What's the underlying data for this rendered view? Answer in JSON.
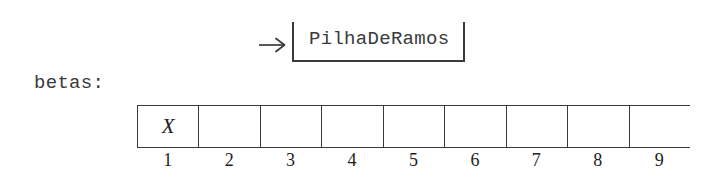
{
  "diagram": {
    "pointer": {
      "arrow_icon": "arrow-right-icon",
      "object_label": "PilhaDeRamos"
    },
    "variable": {
      "label": "betas:"
    },
    "array": {
      "cells": [
        {
          "index": "1",
          "value": "X"
        },
        {
          "index": "2",
          "value": ""
        },
        {
          "index": "3",
          "value": ""
        },
        {
          "index": "4",
          "value": ""
        },
        {
          "index": "5",
          "value": ""
        },
        {
          "index": "6",
          "value": ""
        },
        {
          "index": "7",
          "value": ""
        },
        {
          "index": "8",
          "value": ""
        },
        {
          "index": "9",
          "value": ""
        }
      ]
    }
  },
  "colors": {
    "background": "#ffffff",
    "stroke": "#3a3a3a",
    "text": "#1d1d1d"
  }
}
